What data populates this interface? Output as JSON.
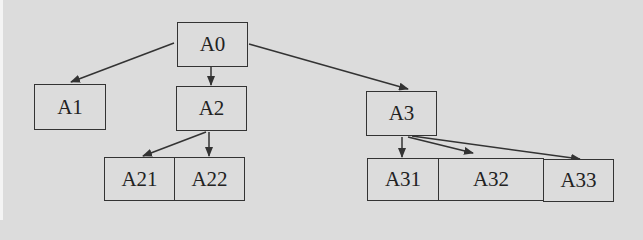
{
  "diagram": {
    "type": "tree",
    "background": "#dcdcdc",
    "line_color": "#333333",
    "nodes": [
      {
        "id": "A0",
        "label": "A0",
        "x": 177,
        "y": 22,
        "w": 71,
        "h": 45
      },
      {
        "id": "A1",
        "label": "A1",
        "x": 34,
        "y": 84,
        "w": 72,
        "h": 46
      },
      {
        "id": "A2",
        "label": "A2",
        "x": 176,
        "y": 86,
        "w": 71,
        "h": 45
      },
      {
        "id": "A3",
        "label": "A3",
        "x": 366,
        "y": 91,
        "w": 71,
        "h": 45
      },
      {
        "id": "A21",
        "label": "A21",
        "x": 104,
        "y": 157,
        "w": 71,
        "h": 44
      },
      {
        "id": "A22",
        "label": "A22",
        "x": 174,
        "y": 157,
        "w": 71,
        "h": 44
      },
      {
        "id": "A31",
        "label": "A31",
        "x": 367,
        "y": 158,
        "w": 72,
        "h": 43
      },
      {
        "id": "A32",
        "label": "A32",
        "x": 438,
        "y": 158,
        "w": 106,
        "h": 43
      },
      {
        "id": "A33",
        "label": "A33",
        "x": 543,
        "y": 159,
        "w": 71,
        "h": 43
      }
    ],
    "edges": [
      {
        "from": "A0",
        "to": "A1",
        "x1": 174,
        "y1": 43,
        "x2": 71,
        "y2": 82
      },
      {
        "from": "A0",
        "to": "A2",
        "x1": 211,
        "y1": 67,
        "x2": 211,
        "y2": 85
      },
      {
        "from": "A0",
        "to": "A3",
        "x1": 249,
        "y1": 44,
        "x2": 408,
        "y2": 89
      },
      {
        "from": "A2",
        "to": "A21",
        "x1": 206,
        "y1": 132,
        "x2": 143,
        "y2": 156
      },
      {
        "from": "A2",
        "to": "A22",
        "x1": 209,
        "y1": 132,
        "x2": 209,
        "y2": 156
      },
      {
        "from": "A3",
        "to": "A31",
        "x1": 402,
        "y1": 137,
        "x2": 402,
        "y2": 157
      },
      {
        "from": "A3",
        "to": "A32",
        "x1": 408,
        "y1": 137,
        "x2": 473,
        "y2": 153
      },
      {
        "from": "A3",
        "to": "A33",
        "x1": 412,
        "y1": 136,
        "x2": 580,
        "y2": 159
      }
    ]
  }
}
